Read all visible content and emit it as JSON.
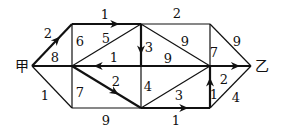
{
  "diagram": {
    "type": "weighted-directed-network",
    "stroke_color": "#111111",
    "background": "#ffffff",
    "nodes": [
      {
        "id": "jia",
        "label": "甲",
        "x": 32,
        "y": 66,
        "lx": 22,
        "ly": 71
      },
      {
        "id": "A",
        "label": "",
        "x": 72,
        "y": 24
      },
      {
        "id": "C",
        "label": "",
        "x": 72,
        "y": 66
      },
      {
        "id": "B",
        "label": "",
        "x": 72,
        "y": 108
      },
      {
        "id": "D",
        "label": "",
        "x": 141,
        "y": 24
      },
      {
        "id": "E",
        "label": "",
        "x": 141,
        "y": 66
      },
      {
        "id": "F",
        "label": "",
        "x": 141,
        "y": 108
      },
      {
        "id": "G",
        "label": "",
        "x": 210,
        "y": 24
      },
      {
        "id": "H",
        "label": "",
        "x": 210,
        "y": 66
      },
      {
        "id": "I",
        "label": "",
        "x": 210,
        "y": 108
      },
      {
        "id": "yi",
        "label": "乙",
        "x": 251,
        "y": 66,
        "lx": 262,
        "ly": 71
      }
    ],
    "edges": [
      {
        "from": "jia",
        "to": "A",
        "weight": "2",
        "directed": true,
        "bold": true,
        "wx": 48,
        "wy": 38
      },
      {
        "from": "jia",
        "to": "C",
        "weight": "8",
        "directed": false,
        "bold": true,
        "wx": 55,
        "wy": 62
      },
      {
        "from": "jia",
        "to": "B",
        "weight": "1",
        "directed": false,
        "bold": false,
        "wx": 45,
        "wy": 100
      },
      {
        "from": "A",
        "to": "D",
        "weight": "1",
        "directed": true,
        "bold": true,
        "wx": 105,
        "wy": 19
      },
      {
        "from": "A",
        "to": "C",
        "weight": "6",
        "directed": false,
        "bold": false,
        "wx": 80,
        "wy": 46
      },
      {
        "from": "C",
        "to": "B",
        "weight": "7",
        "directed": false,
        "bold": false,
        "wx": 80,
        "wy": 97
      },
      {
        "from": "C",
        "to": "D",
        "weight": "5",
        "directed": false,
        "bold": false,
        "wx": 106,
        "wy": 43
      },
      {
        "from": "E",
        "to": "C",
        "weight": "1",
        "directed": true,
        "bold": true,
        "wx": 114,
        "wy": 62
      },
      {
        "from": "C",
        "to": "F",
        "weight": "2",
        "directed": true,
        "bold": true,
        "wx": 116,
        "wy": 86
      },
      {
        "from": "B",
        "to": "F",
        "weight": "9",
        "directed": false,
        "bold": false,
        "wx": 106,
        "wy": 125
      },
      {
        "from": "D",
        "to": "E",
        "weight": "3",
        "directed": true,
        "bold": true,
        "wx": 149,
        "wy": 52
      },
      {
        "from": "E",
        "to": "F",
        "weight": "4",
        "directed": false,
        "bold": false,
        "wx": 148,
        "wy": 91
      },
      {
        "from": "D",
        "to": "G",
        "weight": "2",
        "directed": false,
        "bold": false,
        "wx": 177,
        "wy": 18
      },
      {
        "from": "D",
        "to": "H",
        "weight": "9",
        "directed": false,
        "bold": false,
        "wx": 185,
        "wy": 46
      },
      {
        "from": "E",
        "to": "H",
        "weight": "9",
        "directed": false,
        "bold": true,
        "wx": 168,
        "wy": 63
      },
      {
        "from": "F",
        "to": "H",
        "weight": "3",
        "directed": false,
        "bold": false,
        "wx": 179,
        "wy": 100
      },
      {
        "from": "F",
        "to": "I",
        "weight": "1",
        "directed": true,
        "bold": true,
        "wx": 176,
        "wy": 125
      },
      {
        "from": "G",
        "to": "H",
        "weight": "7",
        "directed": false,
        "bold": false,
        "wx": 214,
        "wy": 57
      },
      {
        "from": "I",
        "to": "H",
        "weight": "1",
        "directed": true,
        "bold": true,
        "wx": 214,
        "wy": 99
      },
      {
        "from": "G",
        "to": "yi",
        "weight": "9",
        "directed": false,
        "bold": false,
        "wx": 237,
        "wy": 46
      },
      {
        "from": "H",
        "to": "yi",
        "weight": "2",
        "directed": true,
        "bold": true,
        "wx": 224,
        "wy": 84
      },
      {
        "from": "I",
        "to": "yi",
        "weight": "4",
        "directed": false,
        "bold": false,
        "wx": 236,
        "wy": 102
      }
    ]
  }
}
